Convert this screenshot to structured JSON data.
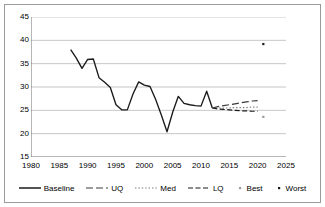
{
  "chart_data": {
    "type": "line",
    "title": "",
    "subtitle": "",
    "xlabel": "",
    "ylabel": "",
    "xlim": [
      1980,
      2025
    ],
    "ylim": [
      15,
      45
    ],
    "xticks": [
      1980,
      1985,
      1990,
      1995,
      2000,
      2005,
      2010,
      2015,
      2020,
      2025
    ],
    "yticks": [
      15,
      20,
      25,
      30,
      35,
      40,
      45
    ],
    "grid": "horizontal",
    "legend_position": "bottom",
    "series": [
      {
        "name": "Baseline",
        "style": "solid",
        "color": "#1a1a1a",
        "x": [
          1987,
          1988,
          1989,
          1990,
          1991,
          1992,
          1993,
          1994,
          1995,
          1996,
          1997,
          1998,
          1999,
          2000,
          2001,
          2002,
          2003,
          2004,
          2005,
          2006,
          2007,
          2008,
          2009,
          2010,
          2011,
          2012
        ],
        "values": [
          38.0,
          36.2,
          34.0,
          35.9,
          36.0,
          32.0,
          31.0,
          29.9,
          26.2,
          25.1,
          25.1,
          28.5,
          31.1,
          30.4,
          30.1,
          27.3,
          24.0,
          20.4,
          24.6,
          28.0,
          26.5,
          26.2,
          26.0,
          25.9,
          29.1,
          25.5
        ]
      },
      {
        "name": "UQ",
        "style": "long-dash",
        "color": "#3a3a3a",
        "x": [
          2012,
          2013,
          2014,
          2015,
          2016,
          2017,
          2018,
          2019,
          2020
        ],
        "values": [
          25.5,
          25.8,
          26.0,
          26.2,
          26.4,
          26.6,
          26.8,
          27.0,
          27.1
        ]
      },
      {
        "name": "Med",
        "style": "dotted",
        "color": "#7a7a7a",
        "x": [
          2012,
          2013,
          2014,
          2015,
          2016,
          2017,
          2018,
          2019,
          2020
        ],
        "values": [
          25.5,
          25.5,
          25.5,
          25.5,
          25.6,
          25.6,
          25.6,
          25.7,
          25.7
        ]
      },
      {
        "name": "LQ",
        "style": "dash",
        "color": "#1a1a1a",
        "x": [
          2012,
          2013,
          2014,
          2015,
          2016,
          2017,
          2018,
          2019,
          2020
        ],
        "values": [
          25.5,
          25.3,
          25.2,
          25.1,
          25.0,
          24.9,
          24.9,
          24.8,
          24.8
        ]
      },
      {
        "name": "Best",
        "style": "point",
        "color": "#9a9a9a",
        "x": [
          2021
        ],
        "values": [
          23.6
        ]
      },
      {
        "name": "Worst",
        "style": "point",
        "color": "#1a1a1a",
        "x": [
          2021
        ],
        "values": [
          39.2
        ]
      }
    ]
  },
  "axes": {
    "y_tick_labels": [
      "45",
      "40",
      "35",
      "30",
      "25",
      "20",
      "15"
    ],
    "x_tick_labels": [
      "1980",
      "1985",
      "1990",
      "1995",
      "2000",
      "2005",
      "2010",
      "2015",
      "2020",
      "2025"
    ]
  },
  "legend": {
    "items": [
      {
        "label": "Baseline",
        "marker": "solid-line-swatch"
      },
      {
        "label": "UQ",
        "marker": "long-dash-line-swatch"
      },
      {
        "label": "Med",
        "marker": "dotted-line-swatch"
      },
      {
        "label": "LQ",
        "marker": "dashed-line-swatch"
      },
      {
        "label": "Best",
        "marker": "light-dot-swatch"
      },
      {
        "label": "Worst",
        "marker": "dark-dot-swatch"
      }
    ]
  },
  "colors": {
    "baseline": "#1a1a1a",
    "uq": "#3a3a3a",
    "med": "#7a7a7a",
    "lq": "#1a1a1a",
    "best": "#9a9a9a",
    "worst": "#1a1a1a",
    "grid": "#b8b8b8",
    "axis": "#6e6e6e",
    "frame": "#9a9a9a",
    "background": "#ffffff"
  }
}
